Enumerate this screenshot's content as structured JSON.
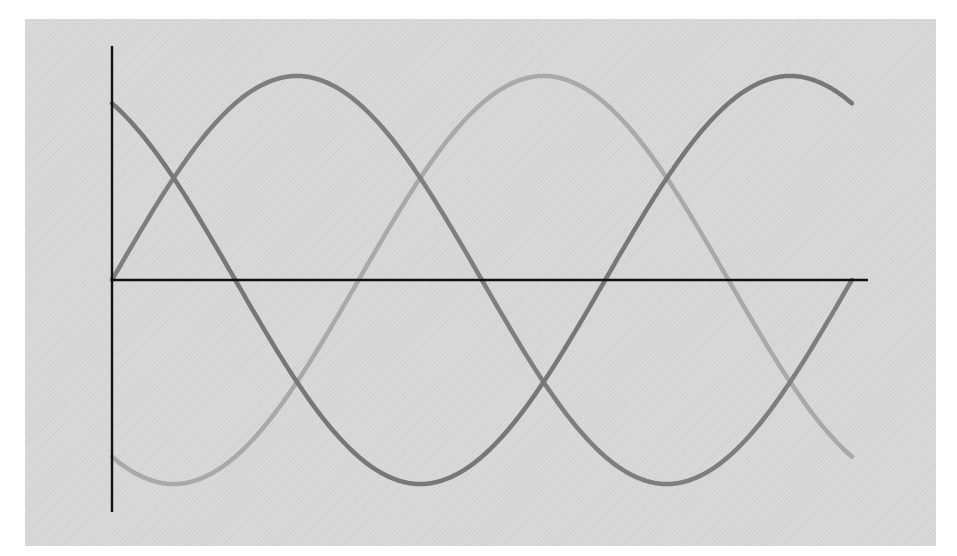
{
  "chart_data": {
    "type": "line",
    "title": "",
    "xlabel": "",
    "ylabel": "",
    "grid": false,
    "legend": null,
    "x_unit": "phase angle (degrees)",
    "xlim": [
      0,
      360
    ],
    "ylim": [
      -1,
      1
    ],
    "x": [
      0,
      30,
      60,
      90,
      120,
      150,
      180,
      210,
      240,
      270,
      300,
      330,
      360
    ],
    "series": [
      {
        "name": "phase-a",
        "phase_deg": 0,
        "color": "#7e7e7e",
        "values": [
          0,
          0.5,
          0.866,
          1,
          0.866,
          0.5,
          0,
          -0.5,
          -0.866,
          -1,
          -0.866,
          -0.5,
          0
        ]
      },
      {
        "name": "phase-b",
        "phase_deg": 120,
        "color": "#777777",
        "values": [
          0.866,
          0.5,
          0,
          -0.5,
          -0.866,
          -1,
          -0.866,
          -0.5,
          0,
          0.5,
          0.866,
          1,
          0.866
        ]
      },
      {
        "name": "phase-c",
        "phase_deg": -120,
        "color": "#a9a9a9",
        "values": [
          -0.866,
          -1,
          -0.866,
          -0.5,
          0,
          0.5,
          0.866,
          1,
          0.866,
          0.5,
          0,
          -0.5,
          -0.866
        ]
      }
    ]
  },
  "colors": {
    "page_background": "#ffffff",
    "panel_background": "#d8d8d8",
    "axis": "#111111"
  },
  "layout": {
    "origin_x": 112,
    "origin_y": 280,
    "x_scale_px_per_deg": 2.055,
    "amplitude_px": 204,
    "y_axis_top": 46,
    "y_axis_bottom": 512,
    "x_axis_end": 868
  }
}
